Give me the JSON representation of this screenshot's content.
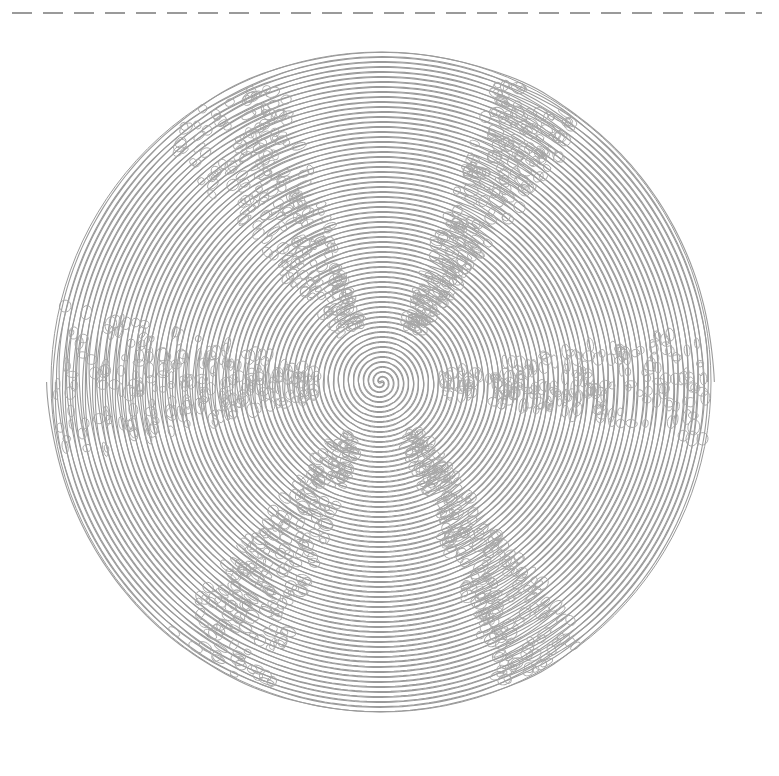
{
  "canvas": {
    "width": 779,
    "height": 776,
    "background": "#ffffff"
  },
  "dashed_line": {
    "y": 13,
    "x_start": 12,
    "x_end": 762,
    "dash": 20,
    "gap": 11,
    "color": "#7a7a7a",
    "stroke_width": 1.3
  },
  "spiral": {
    "center_x": 381,
    "center_y": 382,
    "radius": 330,
    "turns": 33,
    "arms": 2,
    "line_color": "#9a9a9a",
    "line_width": 1.1,
    "band_width": 4.2
  },
  "cells": {
    "color": "#a8a8a8",
    "seams": [
      {
        "angle_deg": 180,
        "spread": 0.16
      },
      {
        "angle_deg": 0,
        "spread": 0.12
      },
      {
        "angle_deg": 120,
        "spread": 0.12
      },
      {
        "angle_deg": 240,
        "spread": 0.14
      },
      {
        "angle_deg": 300,
        "spread": 0.1
      },
      {
        "angle_deg": 60,
        "spread": 0.1
      }
    ]
  }
}
